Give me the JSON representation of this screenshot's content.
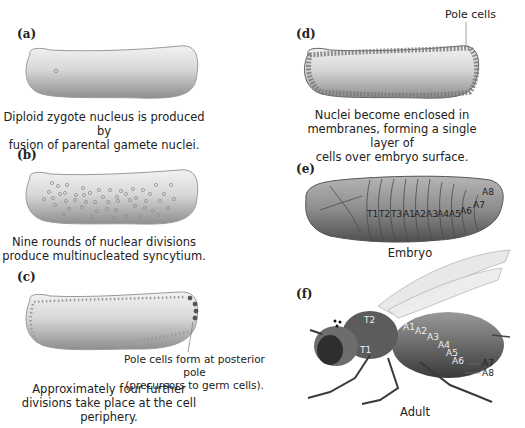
{
  "panels": {
    "a": {
      "label": "(a)",
      "caption": [
        "Diploid zygote nucleus is produced by",
        "fusion of parental gamete nuclei."
      ]
    },
    "b": {
      "label": "(b)",
      "caption": [
        "Nine rounds of nuclear divisions",
        "produce multinucleated syncytium."
      ]
    },
    "c": {
      "label": "(c)",
      "callout": [
        "Pole cells form at posterior pole",
        "(precursors to germ cells)."
      ],
      "caption": [
        "Approximately four further",
        "divisions take place at the cell periphery."
      ]
    },
    "d": {
      "label": "(d)",
      "callout": "Pole cells",
      "caption": [
        "Nuclei become enclosed in",
        "membranes, forming a single layer of",
        "cells over embryo surface."
      ]
    },
    "e": {
      "label": "(e)",
      "caption": "Embryo",
      "segments": [
        "T1",
        "T2",
        "T3",
        "A1",
        "A2",
        "A3",
        "A4",
        "A5",
        "A6",
        "A7",
        "A8"
      ]
    },
    "f": {
      "label": "(f)",
      "caption": "Adult",
      "body_labels": [
        "T1",
        "T2",
        "A1",
        "A2",
        "A3",
        "A4",
        "A5",
        "A6"
      ],
      "callouts": [
        "A7",
        "A8"
      ]
    }
  },
  "colors": {
    "embryo_fill": "#d9d9d9",
    "embryo_dark": "#8a8a8a",
    "nucleus": "#9a9a9a",
    "text": "#222222"
  }
}
